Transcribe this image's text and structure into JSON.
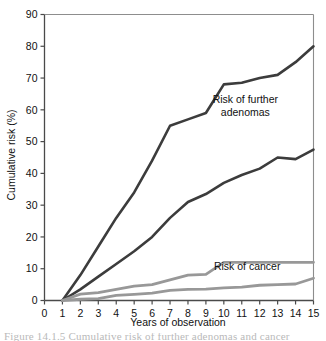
{
  "chart_data": {
    "type": "line",
    "title": "",
    "xlabel": "Years of observation",
    "ylabel": "Cumulative risk (%)",
    "xlim": [
      0,
      15
    ],
    "ylim": [
      0,
      90
    ],
    "xticks": [
      0,
      1,
      2,
      3,
      4,
      5,
      6,
      7,
      8,
      9,
      10,
      11,
      12,
      13,
      14,
      15
    ],
    "yticks": [
      0,
      10,
      20,
      30,
      40,
      50,
      60,
      70,
      80,
      90
    ],
    "grid": false,
    "legend_position": "inline-annotations",
    "annotations": [
      {
        "text": "Risk of further adenomas",
        "x": 11.2,
        "y": 62,
        "lines": [
          "Risk of further",
          "adenomas"
        ]
      },
      {
        "text": "Risk of cancer",
        "x": 11.3,
        "y": 9.5,
        "lines": [
          "Risk of cancer"
        ]
      }
    ],
    "series": [
      {
        "name": "Risk of further adenomas (upper)",
        "color": "#3c3c3c",
        "width": 2.6,
        "x": [
          1,
          2,
          3,
          4,
          5,
          6,
          7,
          8,
          9,
          10,
          11,
          12,
          13,
          14,
          15
        ],
        "values": [
          0,
          8,
          17,
          26,
          34,
          44,
          55,
          57,
          59,
          68,
          68.5,
          70,
          71,
          75,
          80
        ]
      },
      {
        "name": "Risk of further adenomas (lower)",
        "color": "#3c3c3c",
        "width": 2.6,
        "x": [
          1,
          2,
          3,
          4,
          5,
          6,
          7,
          8,
          9,
          10,
          11,
          12,
          13,
          14,
          15
        ],
        "values": [
          0,
          3.5,
          7.5,
          11.5,
          15.5,
          20,
          26,
          31,
          33.5,
          37,
          39.5,
          41.5,
          45,
          44.5,
          47.5
        ]
      },
      {
        "name": "Risk of cancer (upper)",
        "color": "#989898",
        "width": 2.8,
        "x": [
          1,
          2,
          3,
          4,
          5,
          6,
          7,
          8,
          9,
          10,
          11,
          12,
          13,
          14,
          15
        ],
        "values": [
          0,
          2,
          2.5,
          3.5,
          4.5,
          5,
          6.5,
          8,
          8.2,
          12,
          12,
          12,
          12,
          12,
          12
        ]
      },
      {
        "name": "Risk of cancer (lower)",
        "color": "#989898",
        "width": 2.8,
        "x": [
          1,
          2,
          3,
          4,
          5,
          6,
          7,
          8,
          9,
          10,
          11,
          12,
          13,
          14,
          15
        ],
        "values": [
          0,
          0.4,
          0.6,
          1.6,
          1.9,
          2.3,
          3.2,
          3.5,
          3.6,
          4.0,
          4.2,
          4.8,
          5.0,
          5.2,
          7.0
        ]
      }
    ]
  },
  "caption": {
    "partial_text": "Figure 14.1.5  Cumulative risk of further adenomas and cancer"
  }
}
